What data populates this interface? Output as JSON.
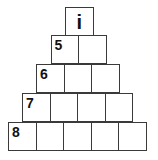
{
  "pyramid": {
    "rows": [
      {
        "cells": 1,
        "label": "i",
        "label_position": "center"
      },
      {
        "cells": 2,
        "label": "5",
        "label_position": "top-left"
      },
      {
        "cells": 3,
        "label": "6",
        "label_position": "top-left"
      },
      {
        "cells": 4,
        "label": "7",
        "label_position": "top-left"
      },
      {
        "cells": 5,
        "label": "8",
        "label_position": "top-left"
      }
    ],
    "border_color": "#3a3a3a"
  }
}
